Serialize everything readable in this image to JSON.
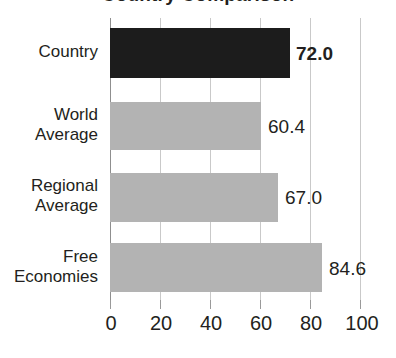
{
  "chart_data": {
    "type": "bar",
    "orientation": "horizontal",
    "title": "",
    "xlabel": "",
    "ylabel": "",
    "xlim": [
      0,
      100
    ],
    "grid": true,
    "legend": "none",
    "categories": [
      "Country",
      "World Average",
      "Regional Average",
      "Free Economies"
    ],
    "values": [
      72.0,
      60.4,
      67.0,
      84.6
    ],
    "value_labels": [
      "72.0",
      "60.4",
      "67.0",
      "84.6"
    ],
    "xticks": [
      0,
      20,
      40,
      60,
      80,
      100
    ],
    "xtick_labels": [
      "0",
      "20",
      "40",
      "60",
      "80",
      "100"
    ],
    "bars": [
      {
        "category": "Country",
        "label_lines": [
          "Country"
        ],
        "value": 72.0,
        "value_label": "72.0",
        "color": "#1c1c1c",
        "emphasis": true
      },
      {
        "category": "World Average",
        "label_lines": [
          "World",
          "Average"
        ],
        "value": 60.4,
        "value_label": "60.4",
        "color": "#b3b3b3",
        "emphasis": false
      },
      {
        "category": "Regional Average",
        "label_lines": [
          "Regional",
          "Average"
        ],
        "value": 67.0,
        "value_label": "67.0",
        "color": "#b3b3b3",
        "emphasis": false
      },
      {
        "category": "Free Economies",
        "label_lines": [
          "Free",
          "Economies"
        ],
        "value": 84.6,
        "value_label": "84.6",
        "color": "#b3b3b3",
        "emphasis": false
      }
    ]
  },
  "colors": {
    "highlight_bar": "#1c1c1c",
    "reference_bar": "#b3b3b3",
    "gridline": "#c9c9c9",
    "axis": "#8f8f8f",
    "text": "#231f20",
    "background": "#ffffff"
  },
  "title_fragment": "Country Comparison"
}
